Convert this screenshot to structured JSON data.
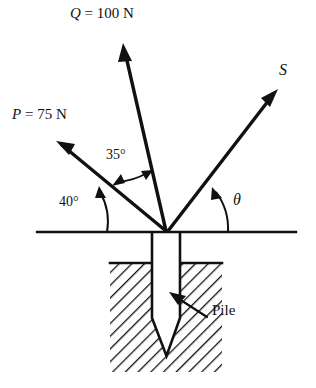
{
  "figure": {
    "ink_color": "#111111",
    "background_color": "#ffffff",
    "labels": {
      "force_q": "Q = 100 N",
      "force_q_symbol": "Q",
      "force_q_value": " = 100 N",
      "force_p": "P = 75 N",
      "force_p_symbol": "P",
      "force_p_value": " = 75 N",
      "force_s": "S",
      "angle_theta": "θ",
      "angle_35": "35°",
      "angle_40": "40°",
      "pile": "Pile"
    },
    "vectors": [
      {
        "name": "P",
        "label": "P = 75 N",
        "magnitude": "75 N",
        "angle_from_ground_deg": 40,
        "direction": "up-left"
      },
      {
        "name": "Q",
        "label": "Q = 100 N",
        "magnitude": "100 N",
        "angle_from_P_deg": 35,
        "direction": "up-left-steep"
      },
      {
        "name": "S",
        "label": "S",
        "magnitude": "",
        "angle_from_ground_deg": "θ",
        "direction": "up-right"
      }
    ],
    "angles": [
      {
        "name": "40-degree",
        "value": "40°",
        "between": "ground-line and P"
      },
      {
        "name": "35-degree",
        "value": "35°",
        "between": "P and Q"
      },
      {
        "name": "theta",
        "value": "θ",
        "between": "ground-line and S"
      }
    ],
    "parts": [
      {
        "name": "pile",
        "label": "Pile"
      },
      {
        "name": "soil",
        "label": ""
      },
      {
        "name": "ground-line",
        "label": ""
      }
    ]
  }
}
